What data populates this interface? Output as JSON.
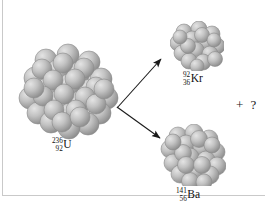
{
  "figure": {
    "caption_clipped": "the chain reaction can continue.",
    "background_color": "#ffffff",
    "rule_color": "#c9c9c9",
    "width": 267,
    "height": 209
  },
  "nuclei": [
    {
      "id": "uranium",
      "name": "uranium-236-nucleus",
      "mass_number": "236",
      "atomic_number": "92",
      "symbol": "U",
      "nucleon_count_drawn": 46,
      "center": {
        "x": 68,
        "y": 88
      },
      "radius": 47,
      "sphere_color": "#b4b4b4",
      "sphere_highlight": "#dedede"
    },
    {
      "id": "krypton",
      "name": "krypton-92-nucleus",
      "mass_number": "92",
      "atomic_number": "36",
      "symbol": "Kr",
      "nucleon_count_drawn": 20,
      "center": {
        "x": 196,
        "y": 45
      },
      "radius": 24,
      "sphere_color": "#b4b4b4",
      "sphere_highlight": "#dedede"
    },
    {
      "id": "barium",
      "name": "barium-141-nucleus",
      "mass_number": "141",
      "atomic_number": "56",
      "symbol": "Ba",
      "nucleon_count_drawn": 26,
      "center": {
        "x": 192,
        "y": 154
      },
      "radius": 30,
      "sphere_color": "#b4b4b4",
      "sphere_highlight": "#dedede"
    }
  ],
  "arrows": {
    "color": "#1a1a1a",
    "origin": {
      "x": 117,
      "y": 108
    },
    "upper_tip": {
      "x": 164,
      "y": 56
    },
    "lower_tip": {
      "x": 164,
      "y": 141
    }
  },
  "annotations": {
    "plus_unknown": "+ ?"
  }
}
